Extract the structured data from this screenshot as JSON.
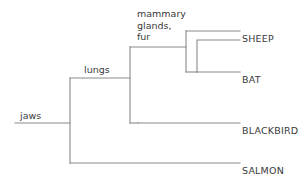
{
  "diagram": {
    "type": "cladogram",
    "title": "",
    "line_color": "#8a8a8a",
    "text_color": "#3a3a3a",
    "background": "#ffffff",
    "taxa": [
      {
        "id": "sheep",
        "label": "SHEEP",
        "x": 242,
        "y": 34
      },
      {
        "id": "bat",
        "label": "BAT",
        "x": 242,
        "y": 75
      },
      {
        "id": "blackbird",
        "label": "BLACKBIRD",
        "x": 242,
        "y": 126
      },
      {
        "id": "salmon",
        "label": "SALMON",
        "x": 242,
        "y": 166
      }
    ],
    "node_labels": [
      {
        "id": "mammary-glands-fur",
        "lines": [
          "mammary",
          "glands,",
          "fur"
        ],
        "x": 137,
        "y": 8
      },
      {
        "id": "lungs",
        "lines": [
          "lungs"
        ],
        "x": 84,
        "y": 64
      },
      {
        "id": "jaws",
        "lines": [
          "jaws"
        ],
        "x": 20,
        "y": 110
      }
    ],
    "branches": [
      {
        "id": "root-stem",
        "d": "M 15 123 L 70 123"
      },
      {
        "id": "root-split",
        "d": "M 70 163 L 70 78"
      },
      {
        "id": "salmon-branch",
        "d": "M 70 163 L 240 163"
      },
      {
        "id": "lungs-stem",
        "d": "M 70 78 L 130 78"
      },
      {
        "id": "amniote-split",
        "d": "M 130 123 L 130 47"
      },
      {
        "id": "blackbird-stem",
        "d": "M 130 123 L 138 123"
      },
      {
        "id": "blackbird-branch",
        "d": "M 138 123 L 240 123"
      },
      {
        "id": "mammal-stem",
        "d": "M 130 47 L 186 47"
      },
      {
        "id": "mammal-split",
        "d": "M 186 72 L 186 31"
      },
      {
        "id": "sheep-branch",
        "d": "M 186 31 L 240 31"
      },
      {
        "id": "bat-stem",
        "d": "M 186 72 L 197 72"
      },
      {
        "id": "bat-branch",
        "d": "M 197 72 L 240 72"
      },
      {
        "id": "inner-mammal-bar",
        "d": "M 197 72 L 197 40 L 240 40"
      }
    ]
  }
}
